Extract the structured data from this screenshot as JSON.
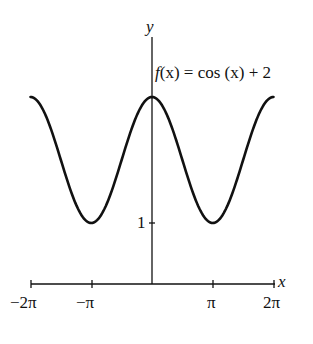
{
  "chart_data": {
    "type": "line",
    "title": "",
    "function_label": "f(x) = cos (x) + 2",
    "xlabel": "x",
    "ylabel": "y",
    "x_ticks": [
      "−2π",
      "−π",
      "π",
      "2π"
    ],
    "x_tick_values": [
      -6.2832,
      -3.1416,
      3.1416,
      6.2832
    ],
    "y_ticks": [
      "1"
    ],
    "y_tick_values": [
      1
    ],
    "xlim": [
      -6.2832,
      6.2832
    ],
    "ylim": [
      0,
      3.6
    ],
    "grid": false,
    "legend": "none",
    "series": [
      {
        "name": "f(x) = cos(x) + 2",
        "x": [
          -6.2832,
          -4.7124,
          -3.1416,
          -1.5708,
          0,
          1.5708,
          3.1416,
          4.7124,
          6.2832
        ],
        "values": [
          3,
          2,
          1,
          2,
          3,
          2,
          1,
          2,
          3
        ]
      }
    ]
  },
  "labels": {
    "y_axis": "y",
    "x_axis": "x",
    "func_prefix": "f",
    "func_rest": "(x) = cos (x) + 2",
    "tick_neg2pi": "−2π",
    "tick_negpi": "−π",
    "tick_pi": "π",
    "tick_2pi": "2π",
    "tick_y1": "1"
  }
}
